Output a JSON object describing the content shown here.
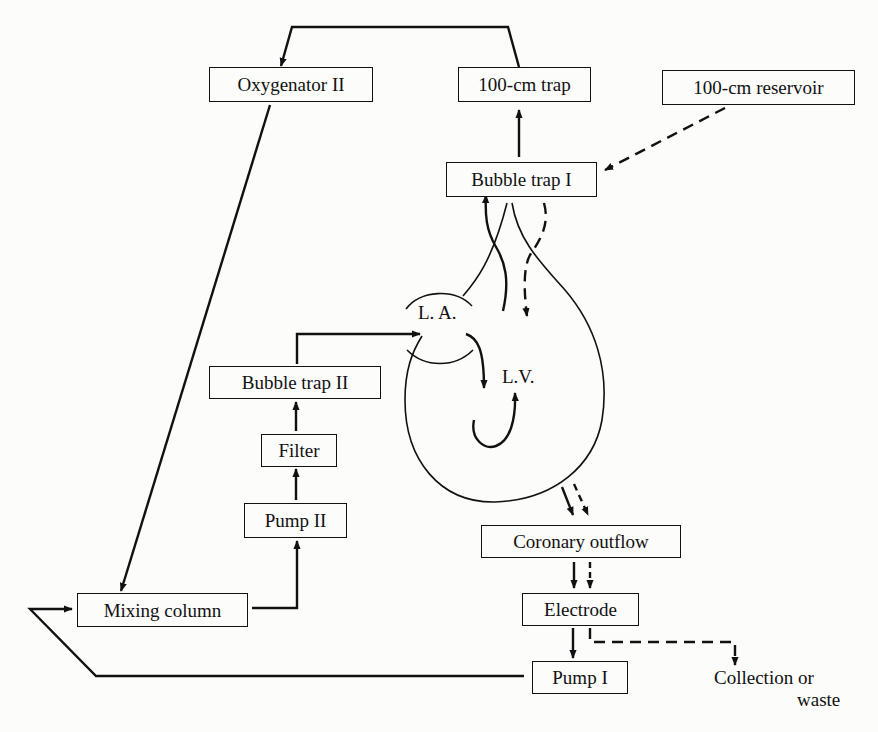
{
  "diagram": {
    "type": "flow-schematic",
    "nodes": {
      "oxygenator_ii": "Oxygenator II",
      "trap_100cm": "100-cm trap",
      "reservoir_100cm": "100-cm reservoir",
      "bubble_trap_i": "Bubble trap I",
      "bubble_trap_ii": "Bubble trap II",
      "filter": "Filter",
      "pump_ii": "Pump II",
      "mixing_column": "Mixing column",
      "coronary_outflow": "Coronary outflow",
      "electrode": "Electrode",
      "pump_i": "Pump I"
    },
    "heart_labels": {
      "left_atrium": "L. A.",
      "left_ventricle": "L.V."
    },
    "outlet": {
      "line1": "Collection or",
      "line2": "waste"
    },
    "edges": [
      {
        "from": "100-cm trap",
        "to": "Oxygenator II",
        "style": "solid"
      },
      {
        "from": "100-cm reservoir",
        "to": "Bubble trap I",
        "style": "dashed"
      },
      {
        "from": "Bubble trap I",
        "to": "100-cm trap",
        "style": "solid"
      },
      {
        "from": "Heart (L.V.)",
        "to": "Bubble trap I",
        "style": "solid"
      },
      {
        "from": "Bubble trap I",
        "to": "Heart (coronary)",
        "style": "dashed"
      },
      {
        "from": "Oxygenator II",
        "to": "Mixing column",
        "style": "solid"
      },
      {
        "from": "Mixing column",
        "to": "Pump II",
        "style": "solid"
      },
      {
        "from": "Pump II",
        "to": "Filter",
        "style": "solid"
      },
      {
        "from": "Filter",
        "to": "Bubble trap II",
        "style": "solid"
      },
      {
        "from": "Bubble trap II",
        "to": "L. A.",
        "style": "solid"
      },
      {
        "from": "L. A.",
        "to": "L.V.",
        "style": "solid"
      },
      {
        "from": "Heart",
        "to": "Coronary outflow",
        "style": "solid+dashed"
      },
      {
        "from": "Coronary outflow",
        "to": "Electrode",
        "style": "solid+dashed"
      },
      {
        "from": "Electrode",
        "to": "Pump I",
        "style": "solid"
      },
      {
        "from": "Electrode",
        "to": "Collection or waste",
        "style": "dashed"
      },
      {
        "from": "Pump I",
        "to": "Mixing column",
        "style": "solid"
      }
    ]
  }
}
